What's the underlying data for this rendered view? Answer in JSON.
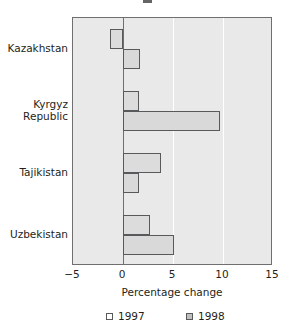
{
  "title_fragment": "",
  "axis": {
    "xlabel": "Percentage change",
    "xticks": [
      "-5",
      "0",
      "5",
      "10",
      "15"
    ],
    "xmin": -5,
    "xmax": 15,
    "gridlines": [
      5,
      10
    ],
    "zero": 0
  },
  "legend": {
    "items": [
      {
        "label": "1997",
        "swatch": "open-square"
      },
      {
        "label": "1998",
        "swatch": "filled-square"
      }
    ]
  },
  "chart_data": {
    "type": "bar",
    "orientation": "horizontal",
    "title": "",
    "xlabel": "Percentage change",
    "ylabel": "",
    "xlim": [
      -5,
      15
    ],
    "xticks": [
      -5,
      0,
      5,
      10,
      15
    ],
    "grid": true,
    "legend_position": "bottom",
    "categories": [
      "Kazakhstan",
      "Kyrgyz Republic",
      "Tajikistan",
      "Uzbekistan"
    ],
    "series": [
      {
        "name": "1997",
        "values": [
          -1.3,
          1.6,
          3.8,
          2.7
        ]
      },
      {
        "name": "1998",
        "values": [
          1.7,
          9.7,
          1.6,
          5.1
        ]
      }
    ],
    "colors": {
      "plot_background": "#e9e9e9",
      "bar_fill": "#dcdcdc",
      "bar_border": "#58595b",
      "gridline": "#ffffff",
      "axis": "#6f6f6f",
      "text": "#231f20"
    }
  }
}
